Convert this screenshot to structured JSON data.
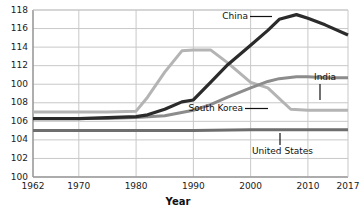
{
  "chart_data": {
    "type": "line",
    "title": "",
    "xlabel": "Year",
    "ylabel": "",
    "grid": true,
    "legend_position": "inline-annotations",
    "xlim": [
      1962,
      2017
    ],
    "ylim": [
      100,
      118
    ],
    "x_ticks": [
      "1962",
      "1970",
      "1980",
      "1990",
      "2000",
      "2010",
      "2017"
    ],
    "y_ticks": [
      "118",
      "116",
      "114",
      "112",
      "100",
      "108",
      "106",
      "104",
      "102",
      "100"
    ],
    "y_tick_values": [
      118,
      116,
      114,
      112,
      110,
      108,
      106,
      104,
      102,
      100
    ],
    "series": [
      {
        "name": "China",
        "color": "#2b2b2b",
        "x": [
          1962,
          1970,
          1975,
          1980,
          1982,
          1985,
          1988,
          1990,
          1993,
          1996,
          2000,
          2003,
          2005,
          2008,
          2010,
          2013,
          2017
        ],
        "values": [
          106.3,
          106.3,
          106.4,
          106.5,
          106.7,
          107.3,
          108.1,
          108.3,
          110.2,
          112.1,
          114.2,
          115.8,
          117.0,
          117.5,
          117.1,
          116.4,
          115.3
        ]
      },
      {
        "name": "South Korea",
        "color": "#b4b4b4",
        "x": [
          1962,
          1970,
          1975,
          1980,
          1982,
          1985,
          1988,
          1990,
          1993,
          1996,
          2000,
          2003,
          2007,
          2010,
          2013,
          2017
        ],
        "values": [
          107.0,
          107.0,
          107.0,
          107.1,
          108.6,
          111.3,
          113.6,
          113.7,
          113.7,
          112.3,
          110.2,
          109.6,
          107.3,
          107.2,
          107.2,
          107.2
        ]
      },
      {
        "name": "India",
        "color": "#8c8c8c",
        "x": [
          1962,
          1970,
          1975,
          1980,
          1985,
          1990,
          1993,
          1996,
          2000,
          2003,
          2005,
          2008,
          2010,
          2013,
          2017
        ],
        "values": [
          106.3,
          106.3,
          106.3,
          106.4,
          106.6,
          107.2,
          107.8,
          108.6,
          109.6,
          110.3,
          110.6,
          110.8,
          110.8,
          110.7,
          110.7
        ]
      },
      {
        "name": "United States",
        "color": "#6e6e6e",
        "x": [
          1962,
          1970,
          1980,
          1990,
          2000,
          2010,
          2017
        ],
        "values": [
          105.0,
          105.0,
          105.0,
          105.0,
          105.1,
          105.1,
          105.1
        ]
      }
    ],
    "annotations": [
      {
        "label": "China",
        "series": "China"
      },
      {
        "label": "India",
        "series": "India"
      },
      {
        "label": "South Korea",
        "series": "South Korea"
      },
      {
        "label": "United States",
        "series": "United States"
      }
    ]
  },
  "style": {
    "grid_color": "#c8c8c8",
    "axis_color": "#9a9a9a",
    "text_color": "#1b1b1b",
    "background": "#ffffff"
  }
}
